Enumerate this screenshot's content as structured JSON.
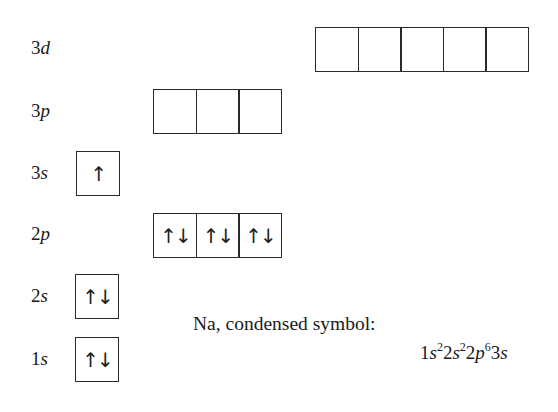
{
  "diagram": {
    "element": "Na",
    "orbitals": [
      {
        "id": "3d",
        "n": "3",
        "sub": "d",
        "boxes": [
          "",
          "",
          "",
          "",
          ""
        ]
      },
      {
        "id": "3p",
        "n": "3",
        "sub": "p",
        "boxes": [
          "",
          "",
          ""
        ]
      },
      {
        "id": "3s",
        "n": "3",
        "sub": "s",
        "boxes": [
          "↑"
        ]
      },
      {
        "id": "2p",
        "n": "2",
        "sub": "p",
        "boxes": [
          "↑↓",
          "↑↓",
          "↑↓"
        ]
      },
      {
        "id": "2s",
        "n": "2",
        "sub": "s",
        "boxes": [
          "↑↓"
        ]
      },
      {
        "id": "1s",
        "n": "1",
        "sub": "s",
        "boxes": [
          "↑↓"
        ]
      }
    ],
    "caption": "Na, condensed symbol:",
    "formula": {
      "parts": [
        {
          "n": "1",
          "sub": "s",
          "sup": "2"
        },
        {
          "n": "2",
          "sub": "s",
          "sup": "2"
        },
        {
          "n": "2",
          "sub": "p",
          "sup": "6"
        },
        {
          "n": "3",
          "sub": "s",
          "sup": ""
        }
      ]
    }
  }
}
